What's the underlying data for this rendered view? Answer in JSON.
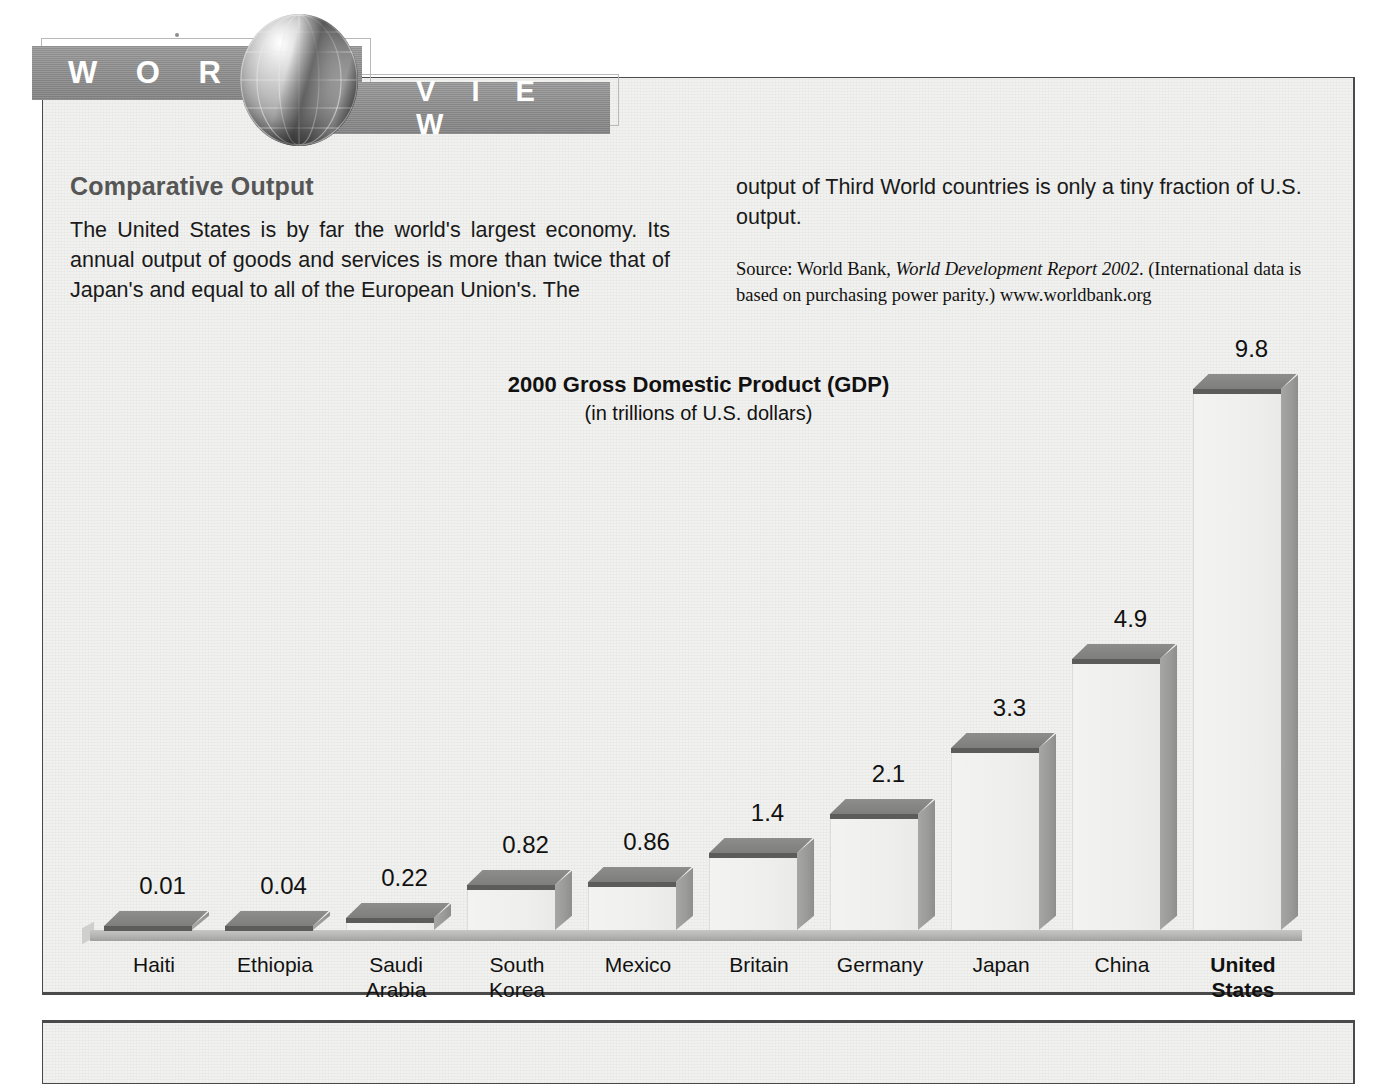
{
  "masthead": {
    "word1": "W O R L D",
    "word2": "V I E W",
    "globe_icon": "globe-icon"
  },
  "article": {
    "section_title": "Comparative Output",
    "left_paragraph": "The United States is by far the world's largest economy. Its annual output of goods and services is more than twice that of Japan's and equal to all of the European Union's. The",
    "right_paragraph": "output of Third World countries is only a tiny fraction of U.S. output.",
    "source_prefix": "Source: World Bank, ",
    "source_italic": "World Development Report 2002",
    "source_suffix": ". (International data is based on purchasing power parity.) www.worldbank.org"
  },
  "chart_data": {
    "type": "bar",
    "title": "2000 Gross Domestic Product (GDP)",
    "subtitle": "(in trillions of U.S. dollars)",
    "xlabel": "",
    "ylabel": "",
    "ylim": [
      0,
      9.8
    ],
    "grid": false,
    "legend": "none",
    "units": "trillions of U.S. dollars",
    "categories": [
      "Haiti",
      "Ethiopia",
      "Saudi\nArabia",
      "South\nKorea",
      "Mexico",
      "Britain",
      "Germany",
      "Japan",
      "China",
      "United\nStates"
    ],
    "values": [
      0.01,
      0.04,
      0.22,
      0.82,
      0.86,
      1.4,
      2.1,
      3.3,
      4.9,
      9.8
    ],
    "value_labels": [
      "0.01",
      "0.04",
      "0.22",
      "0.82",
      "0.86",
      "1.4",
      "2.1",
      "3.3",
      "4.9",
      "9.8"
    ],
    "highlight_category": "United\nStates"
  },
  "colors": {
    "banner": "#8e8e8e",
    "bar_top": "#7e7e7c",
    "bar_front": "#efefed",
    "bar_side": "#9a9a98",
    "paper": "#f1f1ef",
    "heading": "#565656",
    "text": "#111111"
  }
}
